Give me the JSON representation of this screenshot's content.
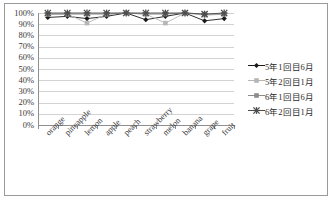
{
  "chart_data": {
    "type": "line",
    "title": "",
    "xlabel": "",
    "ylabel": "",
    "ylim": [
      0,
      100
    ],
    "ytick_labels": [
      "100%",
      "90%",
      "80%",
      "70%",
      "60%",
      "50%",
      "40%",
      "30%",
      "20%",
      "10%",
      "0%"
    ],
    "ytick_values": [
      100,
      90,
      80,
      70,
      60,
      50,
      40,
      30,
      20,
      10,
      0
    ],
    "grid": true,
    "legend_position": "right",
    "categories": [
      "orange",
      "pineapple",
      "lemon",
      "apple",
      "peach",
      "strawberry",
      "melon",
      "banana",
      "grape",
      "fruit"
    ],
    "series": [
      {
        "name": "5年1回目6月",
        "marker": "diamond",
        "color": "#1a1a1a",
        "values": [
          96,
          97,
          95,
          97,
          100,
          94,
          97,
          100,
          93,
          95
        ]
      },
      {
        "name": "5年2回目1月",
        "marker": "square-light",
        "color": "#b6b6b6",
        "values": [
          99,
          99,
          91,
          99,
          100,
          99,
          91,
          100,
          98,
          99
        ]
      },
      {
        "name": "6年1回目6月",
        "marker": "square",
        "color": "#8c8c8c",
        "values": [
          99,
          99,
          99,
          99,
          100,
          99,
          99,
          100,
          99,
          99
        ]
      },
      {
        "name": "6年2回目1月",
        "marker": "star",
        "color": "#4d4d4d",
        "values": [
          100,
          100,
          100,
          100,
          100,
          100,
          100,
          100,
          99,
          100
        ]
      }
    ]
  },
  "legend": {
    "items": [
      {
        "label": "5年1回目6月"
      },
      {
        "label": "5年2回目1月"
      },
      {
        "label": "6年1回目6月"
      },
      {
        "label": "6年2回目1月"
      }
    ]
  }
}
